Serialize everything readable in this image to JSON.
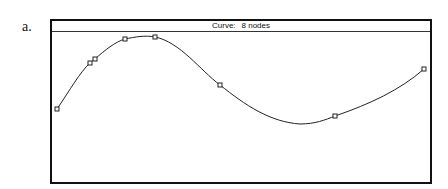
{
  "figure_label": "a.",
  "window": {
    "title_label": "Curve:",
    "title_value": "8 nodes"
  },
  "curve": {
    "node_count": 8,
    "nodes": [
      {
        "x": 57,
        "y": 109
      },
      {
        "x": 90,
        "y": 63
      },
      {
        "x": 95,
        "y": 59
      },
      {
        "x": 125,
        "y": 39
      },
      {
        "x": 155,
        "y": 37
      },
      {
        "x": 220,
        "y": 85
      },
      {
        "x": 335,
        "y": 116
      },
      {
        "x": 424,
        "y": 69
      }
    ],
    "path": "M57,109 C70,90 80,72 90,63 C92,61 93,60 95,59 C105,50 115,42 125,39 C135,37 145,35 155,37 C180,42 200,70 220,85 C245,105 270,122 300,124 C315,124 325,120 335,116 C370,104 400,90 424,69",
    "stroke_color": "#222222"
  }
}
